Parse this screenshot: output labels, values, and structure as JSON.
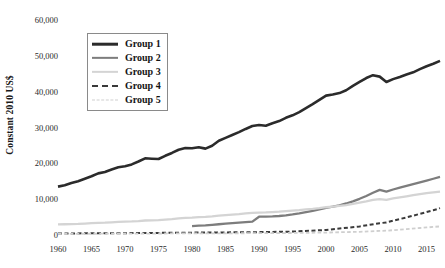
{
  "chart_data": {
    "type": "line",
    "title": "",
    "xlabel": "",
    "ylabel": "Constant 2010 US$",
    "xlim": [
      1960,
      2017
    ],
    "ylim": [
      0,
      60000
    ],
    "grid": false,
    "legend_position": "upper-left",
    "x_ticks": [
      "1960",
      "1965",
      "1970",
      "1975",
      "1980",
      "1985",
      "1990",
      "1995",
      "2000",
      "2005",
      "2010",
      "2015"
    ],
    "x_tick_values": [
      1960,
      1965,
      1970,
      1975,
      1980,
      1985,
      1990,
      1995,
      2000,
      2005,
      2010,
      2015
    ],
    "y_ticks": [
      "0",
      "10,000",
      "20,000",
      "30,000",
      "40,000",
      "50,000",
      "60,000"
    ],
    "y_tick_values": [
      0,
      10000,
      20000,
      30000,
      40000,
      50000,
      60000
    ],
    "series": [
      {
        "name": "Group 1",
        "color": "#2b2b2b",
        "style": "solid",
        "width": 2.6,
        "x": [
          1960,
          1961,
          1962,
          1963,
          1964,
          1965,
          1966,
          1967,
          1968,
          1969,
          1970,
          1971,
          1972,
          1973,
          1974,
          1975,
          1976,
          1977,
          1978,
          1979,
          1980,
          1981,
          1982,
          1983,
          1984,
          1985,
          1986,
          1987,
          1988,
          1989,
          1990,
          1991,
          1992,
          1993,
          1994,
          1995,
          1996,
          1997,
          1998,
          1999,
          2000,
          2001,
          2002,
          2003,
          2004,
          2005,
          2006,
          2007,
          2008,
          2009,
          2010,
          2011,
          2012,
          2013,
          2014,
          2015,
          2016,
          2017
        ],
        "values": [
          13500,
          13900,
          14500,
          15000,
          15700,
          16400,
          17200,
          17600,
          18300,
          18900,
          19200,
          19700,
          20500,
          21400,
          21300,
          21200,
          22100,
          22900,
          23800,
          24300,
          24200,
          24500,
          24100,
          24900,
          26300,
          27100,
          27900,
          28700,
          29600,
          30400,
          30700,
          30500,
          31200,
          31800,
          32700,
          33400,
          34300,
          35400,
          36500,
          37700,
          38900,
          39200,
          39600,
          40400,
          41600,
          42700,
          43800,
          44600,
          44200,
          42700,
          43500,
          44100,
          44800,
          45400,
          46300,
          47100,
          47800,
          48600
        ]
      },
      {
        "name": "Group 2",
        "color": "#7d7d7d",
        "style": "solid",
        "width": 2.3,
        "x": [
          1980,
          1981,
          1982,
          1983,
          1984,
          1985,
          1986,
          1987,
          1988,
          1989,
          1990,
          1991,
          1992,
          1993,
          1994,
          1995,
          1996,
          1997,
          1998,
          1999,
          2000,
          2001,
          2002,
          2003,
          2004,
          2005,
          2006,
          2007,
          2008,
          2009,
          2010,
          2011,
          2012,
          2013,
          2014,
          2015,
          2016,
          2017
        ],
        "values": [
          2500,
          2600,
          2700,
          2850,
          3000,
          3150,
          3300,
          3450,
          3600,
          3750,
          5100,
          5150,
          5200,
          5300,
          5500,
          5750,
          6050,
          6400,
          6750,
          7150,
          7600,
          7900,
          8300,
          8800,
          9400,
          10100,
          10900,
          11800,
          12600,
          12100,
          12700,
          13200,
          13700,
          14200,
          14700,
          15200,
          15700,
          16200
        ]
      },
      {
        "name": "Group 3",
        "color": "#d4d4d4",
        "style": "solid",
        "width": 2.3,
        "x": [
          1960,
          1961,
          1962,
          1963,
          1964,
          1965,
          1966,
          1967,
          1968,
          1969,
          1970,
          1971,
          1972,
          1973,
          1974,
          1975,
          1976,
          1977,
          1978,
          1979,
          1980,
          1981,
          1982,
          1983,
          1984,
          1985,
          1986,
          1987,
          1988,
          1989,
          1990,
          1991,
          1992,
          1993,
          1994,
          1995,
          1996,
          1997,
          1998,
          1999,
          2000,
          2001,
          2002,
          2003,
          2004,
          2005,
          2006,
          2007,
          2008,
          2009,
          2010,
          2011,
          2012,
          2013,
          2014,
          2015,
          2016,
          2017
        ],
        "values": [
          2950,
          3000,
          3050,
          3100,
          3200,
          3300,
          3400,
          3450,
          3550,
          3650,
          3750,
          3800,
          3900,
          4050,
          4100,
          4150,
          4300,
          4450,
          4650,
          4800,
          4850,
          5000,
          5050,
          5200,
          5400,
          5550,
          5700,
          5850,
          6050,
          6200,
          6250,
          6300,
          6400,
          6500,
          6650,
          6800,
          6950,
          7150,
          7300,
          7500,
          7750,
          7900,
          8100,
          8350,
          8700,
          9050,
          9400,
          9800,
          10000,
          9800,
          10200,
          10500,
          10800,
          11100,
          11400,
          11700,
          11900,
          12100
        ]
      },
      {
        "name": "Group 4",
        "color": "#3a3a3a",
        "style": "dashed",
        "width": 2.0,
        "x": [
          1960,
          1965,
          1970,
          1975,
          1980,
          1985,
          1990,
          1995,
          2000,
          2005,
          2008,
          2009,
          2010,
          2012,
          2014,
          2015,
          2016,
          2017
        ],
        "values": [
          430,
          470,
          520,
          590,
          660,
          720,
          800,
          950,
          1400,
          2400,
          3300,
          3500,
          4000,
          4900,
          5900,
          6400,
          6900,
          7500
        ]
      },
      {
        "name": "Group 5",
        "color": "#cfcfcf",
        "style": "dashed",
        "width": 1.8,
        "x": [
          1960,
          1965,
          1970,
          1975,
          1980,
          1985,
          1990,
          1995,
          2000,
          2005,
          2008,
          2009,
          2010,
          2012,
          2014,
          2015,
          2016,
          2017
        ],
        "values": [
          330,
          350,
          380,
          420,
          450,
          470,
          510,
          560,
          680,
          900,
          1150,
          1200,
          1350,
          1650,
          1950,
          2100,
          2250,
          2400
        ]
      }
    ]
  },
  "legend": {
    "items": [
      {
        "label": "Group 1"
      },
      {
        "label": "Group 2"
      },
      {
        "label": "Group 3"
      },
      {
        "label": "Group 4"
      },
      {
        "label": "Group 5"
      }
    ]
  }
}
